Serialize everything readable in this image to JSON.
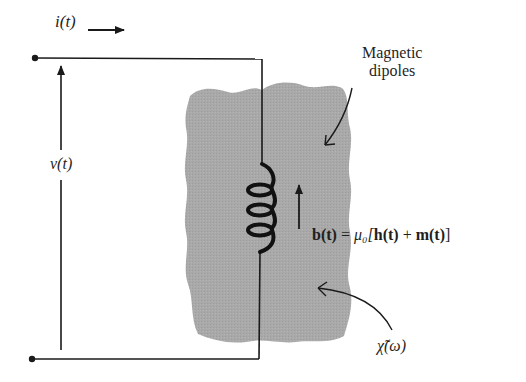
{
  "figure": {
    "current_label": "i(t)",
    "voltage_label": "v(t)",
    "dipoles_label_line1": "Magnetic",
    "dipoles_label_line2": "dipoles",
    "equation": {
      "lhs": "b(t)",
      "equals": " = ",
      "mu": "μ₀[",
      "h": "h(t)",
      "plus": " + ",
      "m": "m(t)",
      "close": "]"
    },
    "susceptibility_label": "χ̃(ω)"
  },
  "colors": {
    "wire": "#1a1a1a",
    "medium_fill": "#a8a8a8",
    "background": "#ffffff"
  }
}
